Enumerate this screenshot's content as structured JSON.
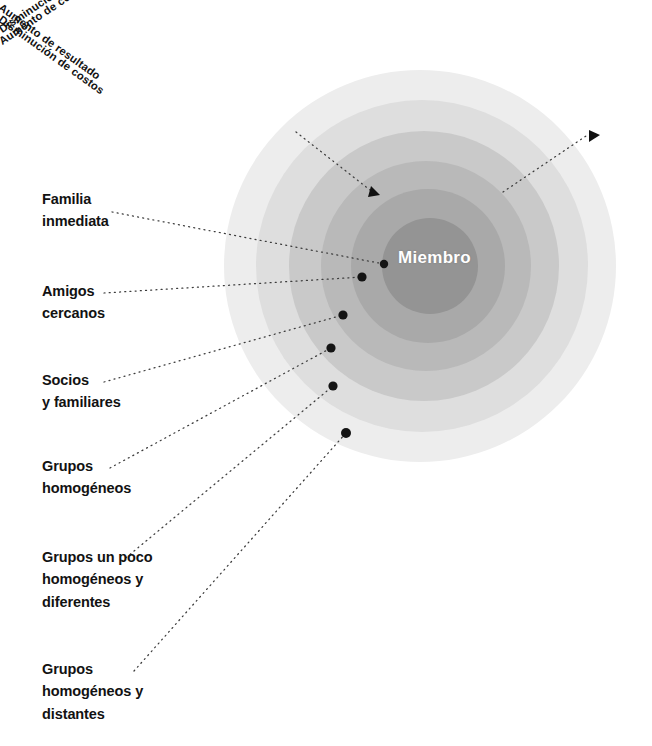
{
  "figure": {
    "center_node": {
      "label": "Miembro"
    },
    "rings": [
      {
        "index": 1,
        "color": "#949494",
        "name": "innermost-ring"
      },
      {
        "index": 2,
        "color": "#a9a9a9",
        "name": "ring-2"
      },
      {
        "index": 3,
        "color": "#b9b9b9",
        "name": "ring-3"
      },
      {
        "index": 4,
        "color": "#c9c9c9",
        "name": "ring-4"
      },
      {
        "index": 5,
        "color": "#dedede",
        "name": "ring-5"
      },
      {
        "index": 6,
        "color": "#ededed",
        "name": "outermost-ring"
      }
    ],
    "axis_labels": {
      "left": [
        {
          "text": "Aumento de resultado"
        },
        {
          "text": "Disminución de costos"
        }
      ],
      "right": [
        {
          "text": "Disminución de resultado"
        },
        {
          "text": "Aumento de costos"
        }
      ]
    },
    "ring_labels": [
      {
        "id": "familia-inmediata",
        "text": "Familia\ninmediata"
      },
      {
        "id": "amigos-cercanos",
        "text": "Amigos\ncercanos"
      },
      {
        "id": "socios-y-familiares",
        "text": "Socios\ny familiares"
      },
      {
        "id": "grupos-homogeneos",
        "text": "Grupos\nhomogéneos"
      },
      {
        "id": "grupos-un-poco-homogeneos-y-diferentes",
        "text": "Grupos un poco\nhomogéneos  y\ndiferentes"
      },
      {
        "id": "grupos-homogeneos-y-distantes",
        "text": "Grupos\nhomogéneos y\ndistantes"
      }
    ],
    "colors": {
      "background": "#ffffff",
      "text": "#121212",
      "center_text": "#ffffff",
      "dot": "#141414",
      "leader_line": "#3c3c3c"
    }
  }
}
